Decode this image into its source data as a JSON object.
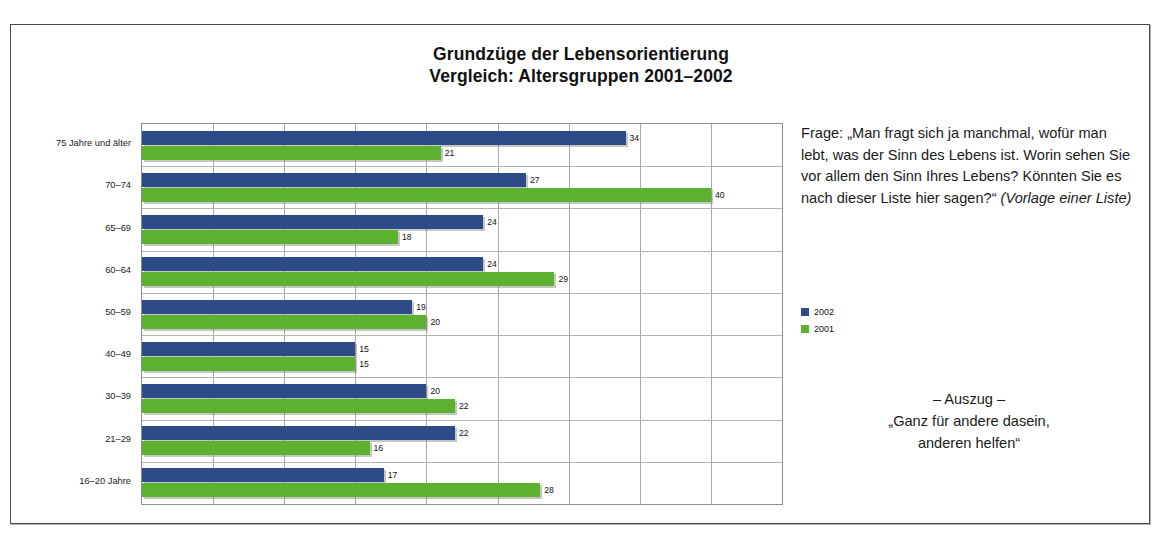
{
  "chart_data": {
    "type": "bar",
    "orientation": "horizontal",
    "title": "Grundzüge der Lebensorientierung",
    "subtitle": "Vergleich: Altersgruppen 2001–2002",
    "xlabel": "",
    "ylabel": "",
    "xlim": [
      0,
      45
    ],
    "xtick_step": 5,
    "grid": true,
    "legend_position": "right",
    "categories": [
      "75 Jahre und älter",
      "70–74",
      "65–69",
      "60–64",
      "50–59",
      "40–49",
      "30–39",
      "21–29",
      "16–20 Jahre"
    ],
    "series": [
      {
        "name": "2002",
        "color": "#2c4b87",
        "values": [
          34,
          27,
          24,
          24,
          19,
          15,
          20,
          22,
          17
        ]
      },
      {
        "name": "2001",
        "color": "#5cb22f",
        "values": [
          21,
          40,
          18,
          29,
          20,
          15,
          22,
          16,
          28
        ]
      }
    ]
  },
  "side": {
    "question_prefix": "Frage: ",
    "question_quote": "„Man fragt sich ja manchmal, wofür man lebt, was der Sinn des Lebens ist. Worin sehen Sie vor allem den Sinn Ihres Lebens? Könnten Sie es nach dieser Liste hier sagen?“ ",
    "question_note": "(Vorlage einer Liste)",
    "excerpt_heading": "– Auszug –",
    "excerpt_line1": "„Ganz für andere dasein,",
    "excerpt_line2": "anderen helfen“"
  },
  "caption_ghost": " "
}
